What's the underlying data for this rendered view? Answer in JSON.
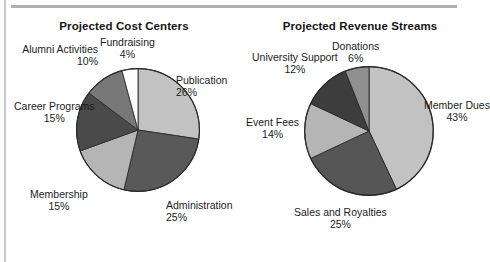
{
  "figure": {
    "background_color": "#ffffff",
    "text_color": "#1c1c1c",
    "rule_color": "#b0b0b0"
  },
  "chart_data": [
    {
      "type": "pie",
      "title": "Projected Cost Centers",
      "categories": [
        "Publication",
        "Administration",
        "Membership",
        "Career Programs",
        "Alumni Activities",
        "Fundraising"
      ],
      "values": [
        26,
        25,
        15,
        15,
        10,
        4
      ],
      "value_labels": [
        "26%",
        "25%",
        "15%",
        "15%",
        "10%",
        "4%"
      ],
      "unit": "%",
      "colors": [
        "#c2c2c2",
        "#595959",
        "#b5b5b5",
        "#4a4a4a",
        "#787878",
        "#fdfdfd"
      ],
      "start_angle_deg": 0,
      "direction": "clockwise",
      "legend": "none",
      "grid": false,
      "labels": [
        {
          "name": "Publication",
          "pct": "26%",
          "align": "left",
          "left": 170,
          "top": 74
        },
        {
          "name": "Administration",
          "pct": "25%",
          "align": "left",
          "left": 160,
          "top": 199
        },
        {
          "name": "Membership",
          "pct": "15%",
          "align": "center",
          "left": 24,
          "top": 188
        },
        {
          "name": "Career Programs",
          "pct": "15%",
          "align": "center",
          "left": 8,
          "top": 100
        },
        {
          "name": "Alumni Activities",
          "pct": "10%",
          "align": "right",
          "left": 0,
          "top": 43
        },
        {
          "name": "Fundraising",
          "pct": "4%",
          "align": "center",
          "left": 94,
          "top": 36
        }
      ]
    },
    {
      "type": "pie",
      "title": "Projected Revenue Streams",
      "categories": [
        "Member Dues",
        "Sales and Royalties",
        "Event Fees",
        "University Support",
        "Donations"
      ],
      "values": [
        43,
        25,
        14,
        12,
        6
      ],
      "value_labels": [
        "43%",
        "25%",
        "14%",
        "12%",
        "6%"
      ],
      "unit": "%",
      "colors": [
        "#c2c2c2",
        "#565656",
        "#b5b5b5",
        "#3d3d3d",
        "#909090"
      ],
      "start_angle_deg": 0,
      "direction": "clockwise",
      "legend": "none",
      "grid": false,
      "labels": [
        {
          "name": "Member Dues",
          "pct": "43%",
          "align": "center",
          "left": 182,
          "top": 99
        },
        {
          "name": "Sales and Royalties",
          "pct": "25%",
          "align": "center",
          "left": 52,
          "top": 206
        },
        {
          "name": "Event Fees",
          "pct": "14%",
          "align": "center",
          "left": 4,
          "top": 116
        },
        {
          "name": "University Support",
          "pct": "12%",
          "align": "center",
          "left": 10,
          "top": 51
        },
        {
          "name": "Donations",
          "pct": "6%",
          "align": "center",
          "left": 90,
          "top": 40
        }
      ]
    }
  ]
}
